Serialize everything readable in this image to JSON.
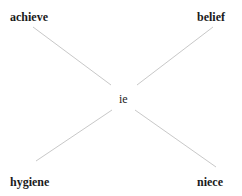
{
  "diagram": {
    "center": {
      "label": "ie"
    },
    "nodes": [
      {
        "position": "top-left",
        "label": "achieve"
      },
      {
        "position": "top-right",
        "label": "belief"
      },
      {
        "position": "bottom-left",
        "label": "hygiene"
      },
      {
        "position": "bottom-right",
        "label": "niece"
      }
    ],
    "edges": [
      {
        "from": "achieve",
        "to": "ie"
      },
      {
        "from": "belief",
        "to": "ie"
      },
      {
        "from": "hygiene",
        "to": "ie"
      },
      {
        "from": "niece",
        "to": "ie"
      }
    ],
    "colors": {
      "line": "#c8c8c8",
      "text": "#1a1a1a",
      "background": "#ffffff"
    }
  }
}
